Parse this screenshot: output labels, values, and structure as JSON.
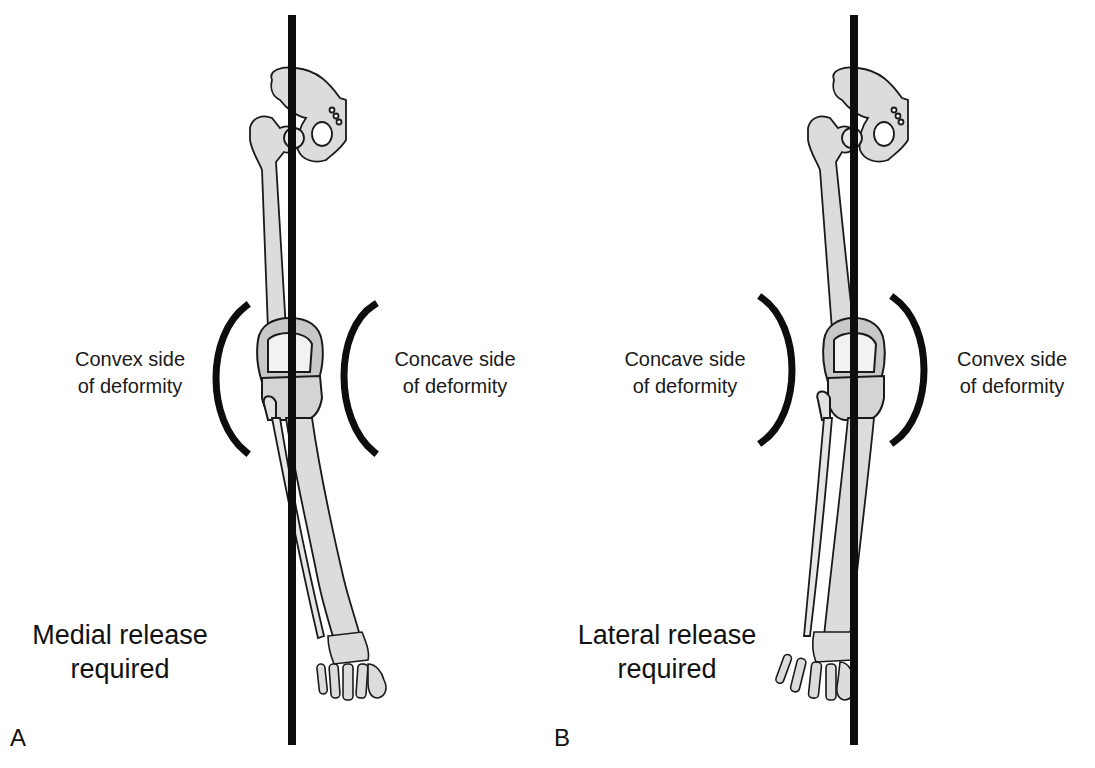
{
  "figure": {
    "panels": [
      {
        "id": "A",
        "letter": "A",
        "variant": "varus",
        "left_label": {
          "line1": "Convex side",
          "line2": "of deformity"
        },
        "right_label": {
          "line1": "Concave side",
          "line2": "of deformity"
        },
        "release": {
          "line1": "Medial release",
          "line2": "required"
        }
      },
      {
        "id": "B",
        "letter": "B",
        "variant": "valgus",
        "left_label": {
          "line1": "Concave side",
          "line2": "of deformity"
        },
        "right_label": {
          "line1": "Convex side",
          "line2": "of deformity"
        },
        "release": {
          "line1": "Lateral release",
          "line2": "required"
        }
      }
    ],
    "colors": {
      "background": "#ffffff",
      "line": "#0d0d0d",
      "bone_fill": "#dcdcdc",
      "bone_shade": "#bdbdbd",
      "bone_outline": "#1a1a1a",
      "text": "#111111"
    }
  }
}
